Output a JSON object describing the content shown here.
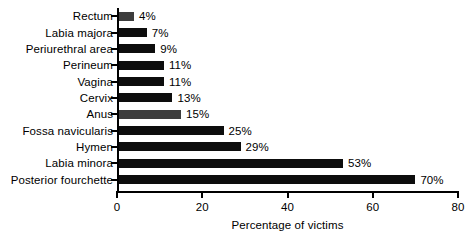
{
  "chart_data": {
    "type": "bar",
    "orientation": "horizontal",
    "title": "",
    "xlabel": "Percentage of victims",
    "ylabel": "",
    "xlim": [
      0,
      80
    ],
    "xticks": [
      0,
      20,
      40,
      60,
      80
    ],
    "xtick_labels": [
      "0",
      "20",
      "40",
      "60",
      "80"
    ],
    "grid": false,
    "legend": null,
    "value_suffix": "%",
    "categories": [
      "Rectum",
      "Labia majora",
      "Periurethral area",
      "Perineum",
      "Vagina",
      "Cervix",
      "Anus",
      "Fossa navicularis",
      "Hymen",
      "Labia minora",
      "Posterior fourchette"
    ],
    "values": [
      4,
      7,
      9,
      11,
      11,
      13,
      15,
      25,
      29,
      53,
      70
    ],
    "value_labels": [
      "4%",
      "7%",
      "9%",
      "11%",
      "11%",
      "13%",
      "15%",
      "25%",
      "29%",
      "53%",
      "70%"
    ],
    "bar_colors": [
      "#3d3d3d",
      "#0d0d0d",
      "#0d0d0d",
      "#0d0d0d",
      "#0d0d0d",
      "#0d0d0d",
      "#3d3d3d",
      "#0d0d0d",
      "#0d0d0d",
      "#0d0d0d",
      "#0d0d0d"
    ]
  },
  "colors": {
    "background": "#ffffff",
    "axis": "#000000",
    "text": "#000000",
    "bar_black": "#0d0d0d",
    "bar_gray": "#3d3d3d"
  }
}
